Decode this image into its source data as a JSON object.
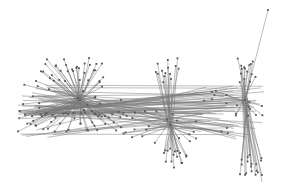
{
  "diagram": {
    "type": "network-graph",
    "colors": {
      "edge": "#7a7a7a",
      "node": "#555555",
      "background": "#ffffff"
    },
    "hubs": [
      {
        "id": "hub-left",
        "spokes_up": 34,
        "spokes_down": 40,
        "spokes_side": 30
      },
      {
        "id": "hub-middle",
        "spokes_up": 14,
        "spokes_down": 16,
        "spokes_side": 24
      },
      {
        "id": "hub-right",
        "spokes_up": 14,
        "spokes_down": 18,
        "spokes_side": 18
      }
    ],
    "cross_edges": 60
  }
}
